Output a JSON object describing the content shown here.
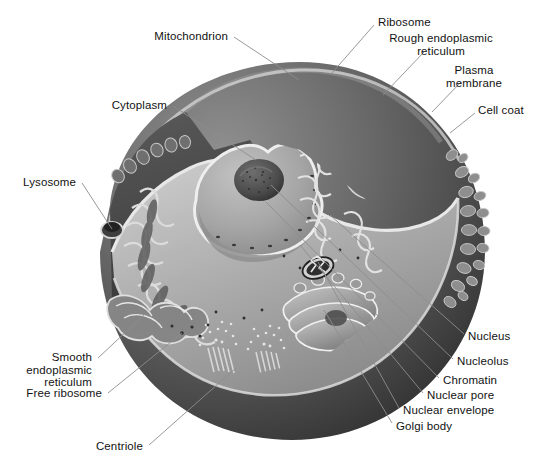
{
  "figure": {
    "style": "grayscale-airbrush-illustration",
    "palette": {
      "background": "#ffffff",
      "label_text": "#121212",
      "leader_line": "#8d8d8d",
      "cell_exterior_dark": "#3c3c3c",
      "cell_exterior_mid": "#6e6e6e",
      "cytosol_light": "#b9b9b9",
      "cut_face_dark": "#4a4a4a",
      "nucleus_fill": "#a9a9a9",
      "nucleolus": "#4e4e4e",
      "membrane_highlight": "#e8e8e8"
    }
  },
  "labels": [
    {
      "id": "mitochondrion",
      "text": "Mitochondrion",
      "align": "right",
      "x": 228,
      "y": 30,
      "lx": 234,
      "ly": 37,
      "tx": 299,
      "ty": 80
    },
    {
      "id": "cytoplasm",
      "text": "Cytoplasm",
      "align": "right",
      "x": 167,
      "y": 99,
      "lx": 173,
      "ly": 106,
      "tx": 256,
      "ty": 160
    },
    {
      "id": "lysosome",
      "text": "Lysosome",
      "align": "right",
      "x": 76,
      "y": 176,
      "lx": 82,
      "ly": 183,
      "tx": 112,
      "ty": 229
    },
    {
      "id": "smooth-er",
      "text": "Smooth\nendoplasmic\nreticulum",
      "align": "right",
      "x": 92,
      "y": 351,
      "lx": 98,
      "ly": 358,
      "tx": 146,
      "ty": 313
    },
    {
      "id": "free-ribosome",
      "text": "Free ribosome",
      "align": "right",
      "x": 102,
      "y": 387,
      "lx": 108,
      "ly": 393,
      "tx": 182,
      "ty": 333
    },
    {
      "id": "centriole",
      "text": "Centriole",
      "align": "right",
      "x": 143,
      "y": 440,
      "lx": 149,
      "ly": 445,
      "tx": 236,
      "ty": 368
    },
    {
      "id": "ribosome",
      "text": "Ribosome",
      "align": "left",
      "x": 378,
      "y": 16,
      "lx": 374,
      "ly": 25,
      "tx": 332,
      "ty": 73
    },
    {
      "id": "rough-er",
      "text": "Rough endoplasmic\nreticulum",
      "align": "center",
      "x": 441,
      "y": 32,
      "lx": 424,
      "ly": 52,
      "tx": 383,
      "ty": 95
    },
    {
      "id": "plasma-membrane",
      "text": "Plasma\nmembrane",
      "align": "center",
      "x": 474,
      "y": 64,
      "lx": 461,
      "ly": 82,
      "tx": 432,
      "ty": 112
    },
    {
      "id": "cell-coat",
      "text": "Cell coat",
      "align": "left",
      "x": 478,
      "y": 104,
      "lx": 475,
      "ly": 113,
      "tx": 450,
      "ty": 133
    },
    {
      "id": "nucleus",
      "text": "Nucleus",
      "align": "left",
      "x": 468,
      "y": 330,
      "lx": 464,
      "ly": 334,
      "tx": 330,
      "ty": 215
    },
    {
      "id": "nucleolus",
      "text": "Nucleolus",
      "align": "left",
      "x": 457,
      "y": 355,
      "lx": 453,
      "ly": 359,
      "tx": 271,
      "ty": 185
    },
    {
      "id": "chromatin",
      "text": "Chromatin",
      "align": "left",
      "x": 443,
      "y": 374,
      "lx": 439,
      "ly": 378,
      "tx": 266,
      "ty": 202
    },
    {
      "id": "nuclear-pore",
      "text": "Nuclear pore",
      "align": "left",
      "x": 427,
      "y": 389,
      "lx": 423,
      "ly": 393,
      "tx": 300,
      "ty": 245
    },
    {
      "id": "nuclear-envelope",
      "text": "Nuclear envelope",
      "align": "left",
      "x": 403,
      "y": 404,
      "lx": 399,
      "ly": 408,
      "tx": 318,
      "ty": 262
    },
    {
      "id": "golgi-body",
      "text": "Golgi body",
      "align": "left",
      "x": 396,
      "y": 420,
      "lx": 392,
      "ly": 423,
      "tx": 324,
      "ty": 310
    }
  ],
  "structures": [
    {
      "id": "cell-body",
      "name": "plasma-membrane-sphere"
    },
    {
      "id": "cut-face",
      "name": "cytoplasm-cut-surface"
    },
    {
      "id": "nucleus-shape",
      "name": "nucleus-cut-sphere"
    },
    {
      "id": "nucleolus-shape",
      "name": "nucleolus-granular-mass"
    },
    {
      "id": "rough-er-shape",
      "name": "rough-endoplasmic-reticulum-stack"
    },
    {
      "id": "smooth-er-shape",
      "name": "smooth-endoplasmic-reticulum-tubules"
    },
    {
      "id": "golgi-shape",
      "name": "golgi-apparatus-cisternae"
    },
    {
      "id": "mitochondrion-shape",
      "name": "mitochondrion-with-cristae"
    },
    {
      "id": "lysosome-shape",
      "name": "lysosome-vesicle"
    },
    {
      "id": "centriole-a",
      "name": "centriole-cylinder-left"
    },
    {
      "id": "centriole-b",
      "name": "centriole-cylinder-right"
    },
    {
      "id": "cell-coat-shape",
      "name": "cell-coat-microvilli"
    },
    {
      "id": "ribosome-dots",
      "name": "ribosome-granules"
    }
  ]
}
